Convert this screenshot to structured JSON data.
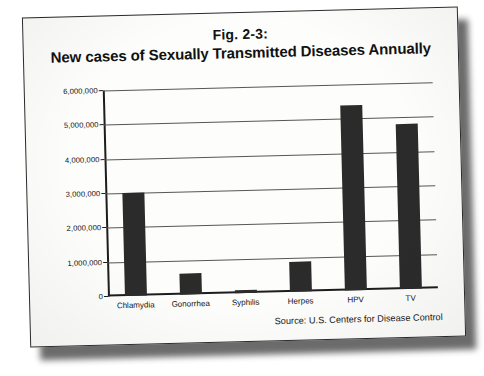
{
  "figure": {
    "title_line1": "Fig. 2-3:",
    "title_line2": "New cases of Sexually Transmitted Diseases Annually",
    "source": "Source: U.S. Centers for Disease Control"
  },
  "colors": {
    "bar": "#2b2b2b",
    "axis": "#1d1d1d",
    "grid": "#565656",
    "paper": "#fdfdfb",
    "text": "#141414"
  },
  "chart_data": {
    "type": "bar",
    "title": "Fig. 2-3: New cases of Sexually Transmitted Diseases Annually",
    "xlabel": "",
    "ylabel": "",
    "categories": [
      "Chlamydia",
      "Gonorrhea",
      "Syphilis",
      "Herpes",
      "HPV",
      "TV"
    ],
    "values": [
      3000000,
      600000,
      80000,
      880000,
      5400000,
      4800000
    ],
    "ylim": [
      0,
      6000000
    ],
    "ytick_labels": [
      "0",
      "1,000,000",
      "2,000,000",
      "3,000,000",
      "4,000,000",
      "5,000,000",
      "6,000,000"
    ],
    "ytick_values": [
      0,
      1000000,
      2000000,
      3000000,
      4000000,
      5000000,
      6000000
    ],
    "grid": true,
    "legend": false,
    "annotations": [
      "Source: U.S. Centers for Disease Control"
    ]
  }
}
